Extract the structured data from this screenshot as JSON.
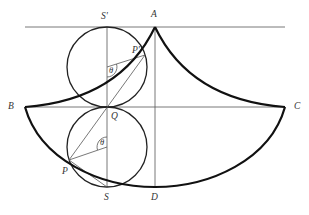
{
  "figure": {
    "type": "geometric-diagram"
  },
  "labels": {
    "S_prime": "S'",
    "A": "A",
    "P_prime": "P'",
    "theta_upper": "θ",
    "B": "B",
    "C": "C",
    "Q": "Q",
    "theta_lower": "θ",
    "P": "P",
    "S": "S",
    "D": "D"
  },
  "colors": {
    "curve": "#111111",
    "circle": "#222222",
    "line": "#555555",
    "text": "#333333",
    "background": "#ffffff"
  }
}
